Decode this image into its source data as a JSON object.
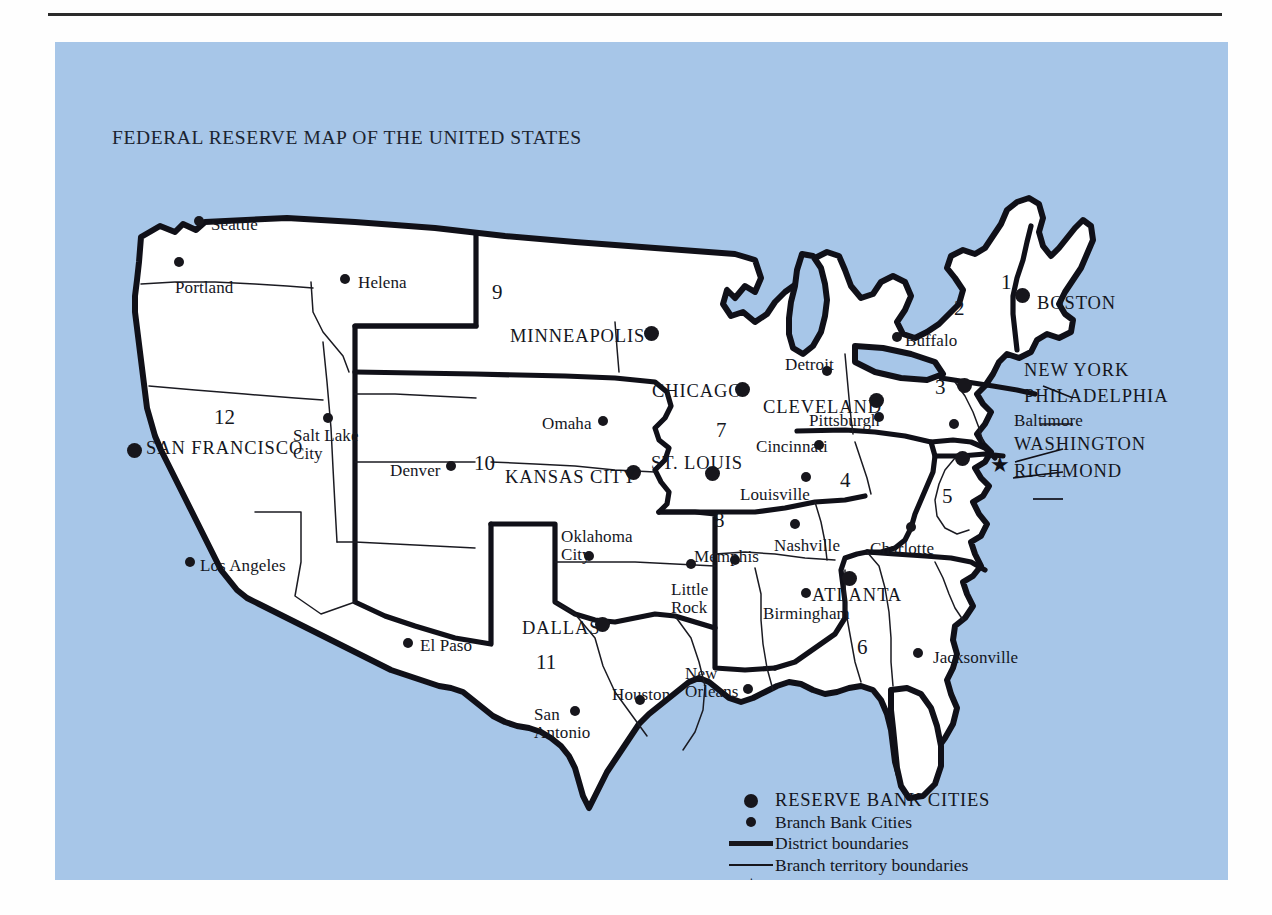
{
  "page": {
    "title": "FEDERAL RESERVE MAP OF THE UNITED STATES",
    "background_color": "#a7c6e8",
    "land_color": "#ffffff",
    "ink_color": "#101018"
  },
  "districts": [
    {
      "number": "1",
      "x": 1001,
      "y": 270
    },
    {
      "number": "2",
      "x": 954,
      "y": 296
    },
    {
      "number": "3",
      "x": 935,
      "y": 375
    },
    {
      "number": "4",
      "x": 840,
      "y": 468
    },
    {
      "number": "5",
      "x": 942,
      "y": 484
    },
    {
      "number": "6",
      "x": 857,
      "y": 635
    },
    {
      "number": "7",
      "x": 716,
      "y": 418
    },
    {
      "number": "8",
      "x": 714,
      "y": 508
    },
    {
      "number": "9",
      "x": 492,
      "y": 280
    },
    {
      "number": "10",
      "x": 474,
      "y": 451
    },
    {
      "number": "11",
      "x": 536,
      "y": 650
    },
    {
      "number": "12",
      "x": 214,
      "y": 405
    }
  ],
  "reserve_cities": [
    {
      "name": "BOSTON",
      "label_x": 1037,
      "label_y": 294,
      "dot_x": 1022,
      "dot_y": 295
    },
    {
      "name": "NEW YORK",
      "label_x": 1024,
      "label_y": 361,
      "dot_x": null,
      "dot_y": null
    },
    {
      "name": "PHILADELPHIA",
      "label_x": 1024,
      "label_y": 387,
      "dot_x": 964,
      "dot_y": 385
    },
    {
      "name": "WASHINGTON",
      "label_x": 1014,
      "label_y": 435,
      "dot_x": null,
      "dot_y": null
    },
    {
      "name": "RICHMOND",
      "label_x": 1014,
      "label_y": 462,
      "dot_x": 962,
      "dot_y": 458
    },
    {
      "name": "CLEVELAND",
      "label_x": 763,
      "label_y": 398,
      "dot_x": 876,
      "dot_y": 400
    },
    {
      "name": "ATLANTA",
      "label_x": 812,
      "label_y": 586,
      "dot_x": 849,
      "dot_y": 578
    },
    {
      "name": "CHICAGO",
      "label_x": 652,
      "label_y": 382,
      "dot_x": 742,
      "dot_y": 389
    },
    {
      "name": "ST. LOUIS",
      "label_x": 651,
      "label_y": 454,
      "dot_x": 712,
      "dot_y": 473
    },
    {
      "name": "MINNEAPOLIS",
      "label_x": 510,
      "label_y": 327,
      "dot_x": 651,
      "dot_y": 333
    },
    {
      "name": "KANSAS CITY",
      "label_x": 505,
      "label_y": 468,
      "dot_x": 633,
      "dot_y": 472
    },
    {
      "name": "DALLAS",
      "label_x": 522,
      "label_y": 619,
      "dot_x": 602,
      "dot_y": 624
    },
    {
      "name": "SAN FRANCISCO",
      "label_x": 146,
      "label_y": 439,
      "dot_x": 134,
      "dot_y": 450
    }
  ],
  "branch_cities": [
    {
      "name": "Seattle",
      "label_x": 211,
      "label_y": 216,
      "dot_x": 199,
      "dot_y": 221
    },
    {
      "name": "Portland",
      "label_x": 175,
      "label_y": 279,
      "dot_x": 179,
      "dot_y": 262
    },
    {
      "name": "Helena",
      "label_x": 358,
      "label_y": 274,
      "dot_x": 345,
      "dot_y": 279
    },
    {
      "name": "Salt Lake\nCity",
      "label_x": 293,
      "label_y": 427,
      "dot_x": 328,
      "dot_y": 418
    },
    {
      "name": "Denver",
      "label_x": 390,
      "label_y": 462,
      "dot_x": 451,
      "dot_y": 466
    },
    {
      "name": "Los Angeles",
      "label_x": 200,
      "label_y": 557,
      "dot_x": 190,
      "dot_y": 562
    },
    {
      "name": "El Paso",
      "label_x": 420,
      "label_y": 637,
      "dot_x": 408,
      "dot_y": 643
    },
    {
      "name": "San\nAntonio",
      "label_x": 534,
      "label_y": 706,
      "dot_x": 575,
      "dot_y": 711
    },
    {
      "name": "Houston",
      "label_x": 612,
      "label_y": 686,
      "dot_x": 640,
      "dot_y": 700
    },
    {
      "name": "Oklahoma\nCity",
      "label_x": 561,
      "label_y": 528,
      "dot_x": 589,
      "dot_y": 556
    },
    {
      "name": "Omaha",
      "label_x": 542,
      "label_y": 415,
      "dot_x": 603,
      "dot_y": 421
    },
    {
      "name": "Little\nRock",
      "label_x": 671,
      "label_y": 581,
      "dot_x": 691,
      "dot_y": 564
    },
    {
      "name": "New\nOrleans",
      "label_x": 685,
      "label_y": 665,
      "dot_x": 748,
      "dot_y": 689
    },
    {
      "name": "Memphis",
      "label_x": 694,
      "label_y": 548,
      "dot_x": 735,
      "dot_y": 560
    },
    {
      "name": "Nashville",
      "label_x": 774,
      "label_y": 537,
      "dot_x": 795,
      "dot_y": 524
    },
    {
      "name": "Birmingham",
      "label_x": 763,
      "label_y": 605,
      "dot_x": 806,
      "dot_y": 593
    },
    {
      "name": "Jacksonville",
      "label_x": 933,
      "label_y": 649,
      "dot_x": 918,
      "dot_y": 653
    },
    {
      "name": "Charlotte",
      "label_x": 870,
      "label_y": 540,
      "dot_x": 911,
      "dot_y": 527
    },
    {
      "name": "Louisville",
      "label_x": 740,
      "label_y": 486,
      "dot_x": 806,
      "dot_y": 477
    },
    {
      "name": "Cincinnati",
      "label_x": 756,
      "label_y": 438,
      "dot_x": 819,
      "dot_y": 445
    },
    {
      "name": "Detroit",
      "label_x": 785,
      "label_y": 356,
      "dot_x": 827,
      "dot_y": 371
    },
    {
      "name": "Pittsburgh",
      "label_x": 809,
      "label_y": 412,
      "dot_x": 879,
      "dot_y": 417
    },
    {
      "name": "Buffalo",
      "label_x": 905,
      "label_y": 332,
      "dot_x": 897,
      "dot_y": 337
    },
    {
      "name": "Baltimore",
      "label_x": 1014,
      "label_y": 412,
      "dot_x": 954,
      "dot_y": 424
    }
  ],
  "legend": {
    "rows": [
      {
        "symbol": "reserve-dot-icon",
        "text": "RESERVE BANK CITIES",
        "style": "caps"
      },
      {
        "symbol": "branch-dot-icon",
        "text": "Branch Bank Cities",
        "style": "normal"
      },
      {
        "symbol": "thick-line-icon",
        "text": "District boundaries",
        "style": "normal"
      },
      {
        "symbol": "thin-line-icon",
        "text": "Branch territory boundaries",
        "style": "normal"
      },
      {
        "symbol": "star-icon",
        "text": "Board of Governors of the Federal Reserve System",
        "style": "normal"
      }
    ]
  },
  "board_of_governors_star": {
    "glyph": "★",
    "x": 935,
    "y": 413
  }
}
